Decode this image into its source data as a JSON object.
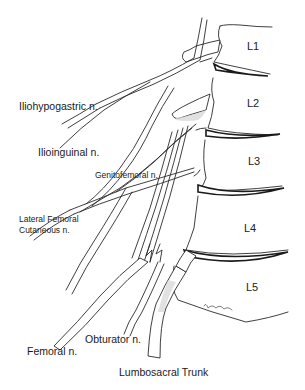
{
  "figure": {
    "vertebrae": [
      {
        "id": "L1",
        "label": "L1"
      },
      {
        "id": "L2",
        "label": "L2"
      },
      {
        "id": "L3",
        "label": "L3"
      },
      {
        "id": "L4",
        "label": "L4"
      },
      {
        "id": "L5",
        "label": "L5"
      }
    ],
    "nerves": [
      {
        "id": "iliohypogastric",
        "label": "Iliohypogastric n."
      },
      {
        "id": "ilioinguinal",
        "label": "Ilioinguinal n."
      },
      {
        "id": "genitofemoral",
        "label": "Genitofemoral n."
      },
      {
        "id": "lateral-femoral-cutaneous",
        "label_line1": "Lateral Femoral",
        "label_line2": "Cutaneous n."
      },
      {
        "id": "femoral",
        "label": "Femoral n."
      },
      {
        "id": "obturator",
        "label": "Obturator n."
      },
      {
        "id": "lumbosacral-trunk",
        "label": "Lumbosacral Trunk"
      }
    ],
    "colors": {
      "line": "#2a2a2a",
      "background": "#ffffff",
      "shade": "#d9d9d9"
    }
  }
}
